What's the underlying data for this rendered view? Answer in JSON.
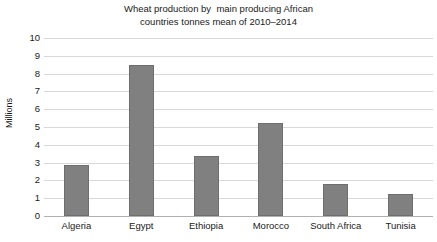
{
  "chart_data": {
    "type": "bar",
    "title": "Wheat production by  main producing African\ncountries tonnes mean of 2010–2014",
    "title_line1": "Wheat production by  main producing African",
    "title_line2": "countries tonnes mean of 2010–2014",
    "xlabel": "",
    "ylabel": "Millions",
    "categories": [
      "Algeria",
      "Egypt",
      "Ethiopia",
      "Morocco",
      "South Africa",
      "Tunisia"
    ],
    "values": [
      2.85,
      8.5,
      3.35,
      5.25,
      1.8,
      1.25
    ],
    "ylim": [
      0,
      10
    ],
    "ytick_labels": [
      "10",
      "9",
      "8",
      "7",
      "6",
      "5",
      "4",
      "3",
      "2",
      "1",
      "0"
    ],
    "yticks": [
      10,
      9,
      8,
      7,
      6,
      5,
      4,
      3,
      2,
      1,
      0
    ],
    "grid": true,
    "legend": null,
    "bar_color": "#808080",
    "bar_edge_color": "#6e6e6e",
    "gridline_color": "#d9d9d9",
    "axis_color": "#b0b0b0",
    "background_color": "#ffffff",
    "text_color": "#1a1a1a"
  }
}
